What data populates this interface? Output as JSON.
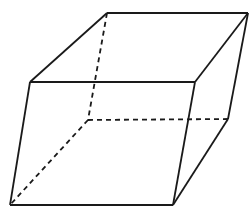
{
  "figure": {
    "caption": "",
    "background_color": "#ffffff",
    "stroke_color": "#1a1a1a",
    "hidden_stroke_color": "#1a1a1a",
    "face_color": "#ffffff",
    "solid_stroke_width": "1.8",
    "hidden_stroke_width": "1.8",
    "hidden_dash_pattern": "5,4",
    "canvas": {
      "width": 252,
      "height": 216
    }
  },
  "geometry": {
    "projection": "oblique",
    "shape": "rectangular_prism",
    "vertices": {
      "top_back_left": {
        "label": "A",
        "x": 107,
        "y": 13,
        "hidden": false
      },
      "top_back_right": {
        "label": "B",
        "x": 248,
        "y": 13,
        "hidden": false
      },
      "top_front_left": {
        "label": "C",
        "x": 30,
        "y": 82,
        "hidden": false
      },
      "top_front_right": {
        "label": "D",
        "x": 195,
        "y": 82,
        "hidden": false
      },
      "bottom_back_left": {
        "label": "E",
        "x": 88,
        "y": 120,
        "hidden": true
      },
      "bottom_back_right": {
        "label": "F",
        "x": 228,
        "y": 119,
        "hidden": true
      },
      "bottom_front_left": {
        "label": "G",
        "x": 10,
        "y": 205,
        "hidden": false
      },
      "bottom_front_right": {
        "label": "H",
        "x": 173,
        "y": 205,
        "hidden": false
      }
    },
    "faces": [
      {
        "name": "top-face",
        "points": "107,13 248,13 195,82 30,82",
        "visible": true
      },
      {
        "name": "front-face",
        "points": "30,82 195,82 173,205 10,205",
        "visible": true
      },
      {
        "name": "right-face",
        "points": "195,82 248,13 228,119 173,205",
        "visible": true
      }
    ],
    "edges_solid": [
      {
        "name": "top-back-edge",
        "x1": 107,
        "y1": 13,
        "x2": 248,
        "y2": 13
      },
      {
        "name": "top-left-edge",
        "x1": 107,
        "y1": 13,
        "x2": 30,
        "y2": 82
      },
      {
        "name": "top-right-edge",
        "x1": 248,
        "y1": 13,
        "x2": 195,
        "y2": 82
      },
      {
        "name": "top-front-edge",
        "x1": 30,
        "y1": 82,
        "x2": 195,
        "y2": 82
      },
      {
        "name": "front-left-vertical",
        "x1": 30,
        "y1": 82,
        "x2": 10,
        "y2": 205
      },
      {
        "name": "front-right-vertical",
        "x1": 195,
        "y1": 82,
        "x2": 173,
        "y2": 205
      },
      {
        "name": "bottom-front-edge",
        "x1": 10,
        "y1": 205,
        "x2": 173,
        "y2": 205
      },
      {
        "name": "back-right-vertical",
        "x1": 248,
        "y1": 13,
        "x2": 228,
        "y2": 119
      },
      {
        "name": "bottom-right-edge",
        "x1": 228,
        "y1": 119,
        "x2": 173,
        "y2": 205
      }
    ],
    "edges_hidden": [
      {
        "name": "back-left-vertical-hidden",
        "x1": 107,
        "y1": 13,
        "x2": 88,
        "y2": 120
      },
      {
        "name": "bottom-back-edge-hidden",
        "x1": 88,
        "y1": 120,
        "x2": 228,
        "y2": 119
      },
      {
        "name": "bottom-left-edge-hidden",
        "x1": 88,
        "y1": 120,
        "x2": 10,
        "y2": 205
      }
    ]
  }
}
